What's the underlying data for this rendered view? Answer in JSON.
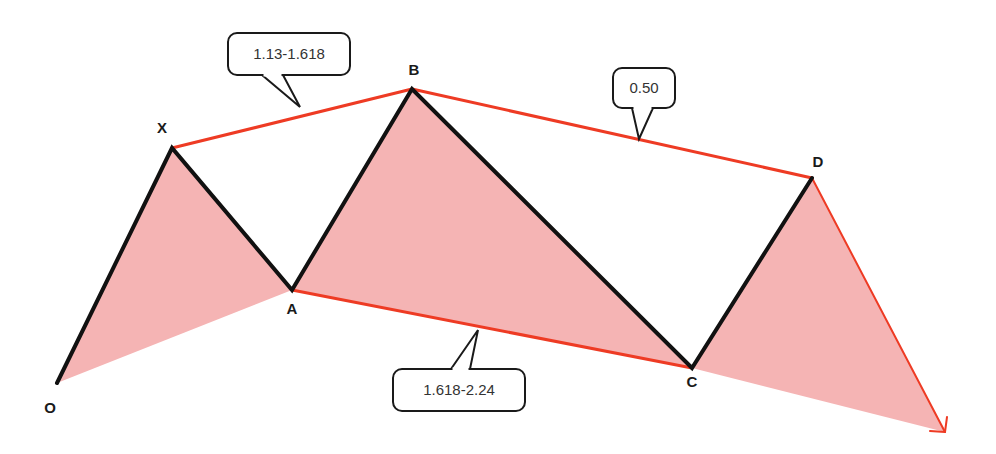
{
  "diagram": {
    "type": "harmonic-pattern",
    "colors": {
      "fill": "#f5b4b4",
      "leg": "#111111",
      "ratio_line": "#ee3b24",
      "callout_border": "#1a1a1a",
      "callout_bg": "#ffffff"
    },
    "points": [
      {
        "id": "O",
        "label": "O",
        "x": 57,
        "y": 383,
        "lx": 50,
        "ly": 413
      },
      {
        "id": "X",
        "label": "X",
        "x": 172,
        "y": 148,
        "lx": 162,
        "ly": 133
      },
      {
        "id": "A",
        "label": "A",
        "x": 292,
        "y": 290,
        "lx": 292,
        "ly": 314
      },
      {
        "id": "B",
        "label": "B",
        "x": 412,
        "y": 89,
        "lx": 414,
        "ly": 75
      },
      {
        "id": "C",
        "label": "C",
        "x": 692,
        "y": 368,
        "lx": 692,
        "ly": 387
      },
      {
        "id": "D",
        "label": "D",
        "x": 812,
        "y": 178,
        "lx": 818,
        "ly": 167
      }
    ],
    "projection_tip": {
      "x": 945,
      "y": 432
    },
    "callouts": [
      {
        "id": "xb",
        "label": "1.13-1.618",
        "box": {
          "x": 228,
          "y": 33,
          "w": 122,
          "h": 42
        },
        "tail": [
          [
            262,
            75
          ],
          [
            300,
            107
          ],
          [
            283,
            75
          ]
        ]
      },
      {
        "id": "bd",
        "label": "0.50",
        "box": {
          "x": 613,
          "y": 68,
          "w": 62,
          "h": 40
        },
        "tail": [
          [
            632,
            108
          ],
          [
            639,
            139
          ],
          [
            653,
            108
          ]
        ]
      },
      {
        "id": "ac",
        "label": "1.618-2.24",
        "box": {
          "x": 393,
          "y": 369,
          "w": 132,
          "h": 42
        },
        "tail": [
          [
            451,
            369
          ],
          [
            478,
            330
          ],
          [
            470,
            369
          ]
        ]
      }
    ]
  }
}
